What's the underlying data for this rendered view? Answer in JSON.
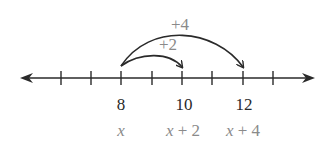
{
  "diagram": {
    "type": "number-line",
    "ticks": [
      {
        "x": 61
      },
      {
        "x": 91
      },
      {
        "x": 121
      },
      {
        "x": 152
      },
      {
        "x": 182
      },
      {
        "x": 212
      },
      {
        "x": 243
      },
      {
        "x": 273
      }
    ],
    "number_labels": [
      {
        "text": "8",
        "x": 121
      },
      {
        "text": "10",
        "x": 182
      },
      {
        "text": "12",
        "x": 243
      }
    ],
    "expression_labels": [
      {
        "text": "x",
        "x": 121
      },
      {
        "text": "x + 2",
        "x": 182
      },
      {
        "text": "x + 4",
        "x": 243
      }
    ],
    "arcs": [
      {
        "label": "+2",
        "from": 8,
        "to": 10
      },
      {
        "label": "+4",
        "from": 8,
        "to": 12
      }
    ],
    "colors": {
      "line": "#2a2a2a",
      "number_text": "#2a2a2a",
      "expression_text": "#8a8a8a",
      "arc_label": "#8a8a8a"
    }
  },
  "labels": {
    "n8": "8",
    "n10": "10",
    "n12": "12",
    "e_x": "x",
    "e_x2_var": "x",
    "e_x2_rest": " + 2",
    "e_x4_var": "x",
    "e_x4_rest": " + 4",
    "arc2": "+2",
    "arc4": "+4"
  }
}
